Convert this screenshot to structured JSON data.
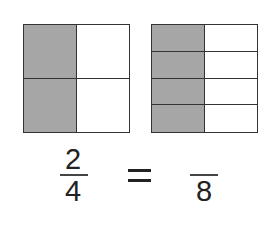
{
  "diagram": {
    "left_model": {
      "columns": 2,
      "rows": 2,
      "shaded_column": 1,
      "shaded_cells": 2,
      "total_cells": 4,
      "cells": [
        {
          "shaded": true
        },
        {
          "shaded": false
        },
        {
          "shaded": true
        },
        {
          "shaded": false
        }
      ]
    },
    "right_model": {
      "columns": 2,
      "rows": 4,
      "shaded_column": 1,
      "shaded_cells": 4,
      "total_cells": 8,
      "cells": [
        {
          "shaded": true
        },
        {
          "shaded": false
        },
        {
          "shaded": true
        },
        {
          "shaded": false
        },
        {
          "shaded": true
        },
        {
          "shaded": false
        },
        {
          "shaded": true
        },
        {
          "shaded": false
        }
      ]
    },
    "equation": {
      "left_fraction": {
        "numerator": "2",
        "denominator": "4"
      },
      "operator": "=",
      "right_fraction": {
        "numerator": "",
        "denominator": "8"
      }
    },
    "colors": {
      "shaded": "#a6a6a6",
      "border": "#333333",
      "background": "#ffffff"
    }
  }
}
